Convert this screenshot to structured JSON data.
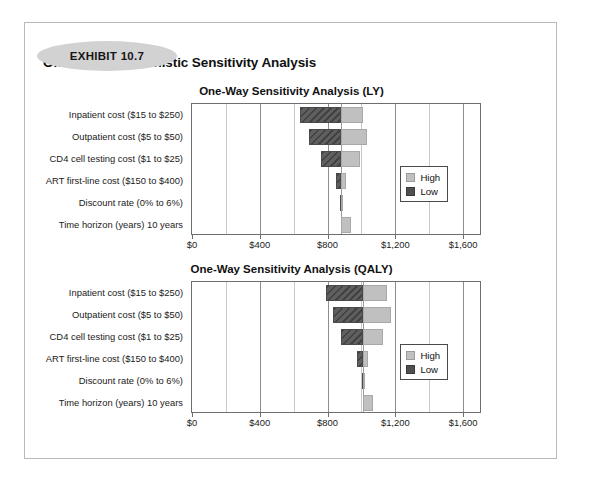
{
  "exhibit": {
    "badge_label": "EXHIBIT 10.7"
  },
  "document": {
    "title": "One-Way Deterministic Sensitivity Analysis"
  },
  "legend": {
    "high_label": "High",
    "low_label": "Low"
  },
  "colors": {
    "low_bar": "#5f5f5f",
    "high_bar": "#c0c0c0",
    "frame": "#b9b9b9",
    "badge": "#d2d2d2",
    "gridline": "#8e8e8e"
  },
  "chart_data": [
    {
      "type": "bar",
      "title": "One-Way Sensitivity Analysis (LY)",
      "orientation": "horizontal",
      "subtype": "tornado",
      "xlabel": "",
      "ylabel": "",
      "xlim": [
        0,
        1700
      ],
      "baseline": 880,
      "grid": true,
      "legend_position": "inside-right",
      "xticks": [
        0,
        400,
        800,
        1200,
        1600
      ],
      "xtick_labels": [
        "$0",
        "$400",
        "$800",
        "$1,200",
        "$1,600"
      ],
      "categories": [
        "Inpatient cost ($15 to $250)",
        "Outpatient cost ($5 to $50)",
        "CD4 cell testing cost ($1 to $25)",
        "ART first-line cost ($150 to $400)",
        "Discount rate (0% to 6%)",
        "Time horizon (years) 10 years"
      ],
      "series": [
        {
          "name": "Low",
          "values": [
            640,
            690,
            760,
            850,
            876,
            880
          ]
        },
        {
          "name": "High",
          "values": [
            1010,
            1035,
            990,
            910,
            884,
            940
          ]
        }
      ]
    },
    {
      "type": "bar",
      "title": "One-Way Sensitivity Analysis (QALY)",
      "orientation": "horizontal",
      "subtype": "tornado",
      "xlabel": "",
      "ylabel": "",
      "xlim": [
        0,
        1700
      ],
      "baseline": 1010,
      "grid": true,
      "legend_position": "inside-right",
      "xticks": [
        0,
        400,
        800,
        1200,
        1600
      ],
      "xtick_labels": [
        "$0",
        "$400",
        "$800",
        "$1,200",
        "$1,600"
      ],
      "categories": [
        "Inpatient cost ($15 to $250)",
        "Outpatient cost ($5 to $50)",
        "CD4 cell testing cost ($1 to $25)",
        "ART first-line cost ($150 to $400)",
        "Discount rate (0% to 6%)",
        "Time horizon (years) 10 years"
      ],
      "series": [
        {
          "name": "Low",
          "values": [
            790,
            830,
            880,
            975,
            1005,
            1010
          ]
        },
        {
          "name": "High",
          "values": [
            1150,
            1175,
            1125,
            1040,
            1014,
            1070
          ]
        }
      ]
    }
  ]
}
